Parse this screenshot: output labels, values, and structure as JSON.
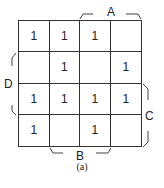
{
  "kmap": {
    "cells": [
      [
        "1",
        "1",
        "1",
        ""
      ],
      [
        "",
        "1",
        "",
        "1"
      ],
      [
        "1",
        "1",
        "1",
        "1"
      ],
      [
        "1",
        "",
        "1",
        ""
      ]
    ],
    "labels": {
      "A": "A",
      "B": "B",
      "C": "C",
      "D": "D"
    }
  },
  "caption": "(a)"
}
